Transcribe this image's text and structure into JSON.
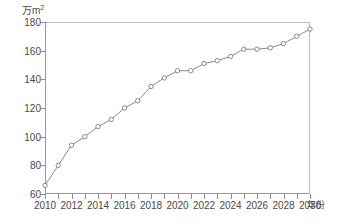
{
  "chart_data": {
    "type": "line",
    "title": "",
    "subtitle": "",
    "xlabel": "年份",
    "ylabel": "万m²",
    "ylabel_unit_base": "万m",
    "ylabel_unit_sup": "2",
    "xlim": [
      2010,
      2030
    ],
    "ylim": [
      60,
      180
    ],
    "y_ticks": [
      180,
      160,
      140,
      120,
      100,
      80,
      60
    ],
    "x_ticks": [
      2010,
      2011,
      2012,
      2013,
      2014,
      2015,
      2016,
      2017,
      2018,
      2019,
      2020,
      2021,
      2022,
      2023,
      2024,
      2025,
      2026,
      2027,
      2028,
      2029,
      2030
    ],
    "x_tick_labels": [
      "2010",
      "2012",
      "2014",
      "2016",
      "2018",
      "2020",
      "2022",
      "2024",
      "2026",
      "2028",
      "2030"
    ],
    "x_tick_label_values": [
      2010,
      2012,
      2014,
      2016,
      2018,
      2020,
      2022,
      2024,
      2026,
      2028,
      2030
    ],
    "grid": false,
    "legend": false,
    "legend_position": "none",
    "marker": "open-circle",
    "line_color": "#8a8a8a",
    "marker_edge_color": "#7d7d7d",
    "marker_face_color": "#ffffff",
    "axis_color": "#9a9a9a",
    "text_color": "#4a4a4a",
    "background_color": "#ffffff",
    "x": [
      2010,
      2011,
      2012,
      2013,
      2014,
      2015,
      2016,
      2017,
      2018,
      2019,
      2020,
      2021,
      2022,
      2023,
      2024,
      2025,
      2026,
      2027,
      2028,
      2029,
      2030
    ],
    "values": [
      66,
      80,
      94,
      100,
      107,
      112,
      120,
      125,
      135,
      141,
      146,
      146,
      151,
      153,
      156,
      161,
      161,
      162,
      165,
      170,
      175
    ],
    "series": [
      {
        "name": "",
        "values": [
          66,
          80,
          94,
          100,
          107,
          112,
          120,
          125,
          135,
          141,
          146,
          146,
          151,
          153,
          156,
          161,
          161,
          162,
          165,
          170,
          175
        ]
      }
    ]
  }
}
